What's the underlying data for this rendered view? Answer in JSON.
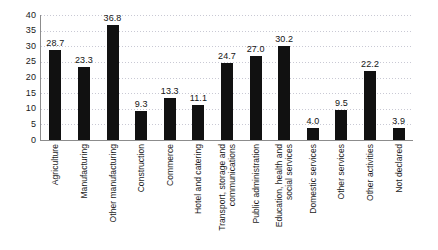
{
  "chart_data": {
    "type": "bar",
    "title": "",
    "subtitle": "",
    "xlabel": "",
    "ylabel": "",
    "ylim": [
      0,
      40
    ],
    "ytick_step": 5,
    "grid": true,
    "grid_axis": "y",
    "grid_style": "dotted",
    "legend": false,
    "legend_position": "none",
    "bar_color": "#111111",
    "gridline_color": "#c9c9d4",
    "axis_color": "#8c8c8c",
    "value_labels_shown": true,
    "categories": [
      "Agriculture",
      "Manufacturing",
      "Other manufacturing",
      "Construction",
      "Commerce",
      "Hotel and catering",
      "Transport, storage and communications",
      "Public administration",
      "Education, health and social services",
      "Domestic services",
      "Other services",
      "Other activities",
      "Not declared"
    ],
    "category_lines": [
      [
        "Agriculture"
      ],
      [
        "Manufacturing"
      ],
      [
        "Other manufacturing"
      ],
      [
        "Construction"
      ],
      [
        "Commerce"
      ],
      [
        "Hotel and catering"
      ],
      [
        "Transport, storage and",
        "communications"
      ],
      [
        "Public administration"
      ],
      [
        "Education, health and",
        "social services"
      ],
      [
        "Domestic services"
      ],
      [
        "Other services"
      ],
      [
        "Other activities"
      ],
      [
        "Not declared"
      ]
    ],
    "values": [
      28.7,
      23.3,
      36.8,
      9.3,
      13.3,
      11.1,
      24.7,
      27.0,
      30.2,
      4.0,
      9.5,
      22.2,
      3.9
    ],
    "value_labels": [
      "28.7",
      "23.3",
      "36.8",
      "9.3",
      "13.3",
      "11.1",
      "24.7",
      "27.0",
      "30.2",
      "4.0",
      "9.5",
      "22.2",
      "3.9"
    ],
    "yticks": [
      0,
      5,
      10,
      15,
      20,
      25,
      30,
      35,
      40
    ],
    "ytick_labels": [
      "0",
      "5",
      "10",
      "15",
      "20",
      "25",
      "30",
      "35",
      "40"
    ]
  }
}
